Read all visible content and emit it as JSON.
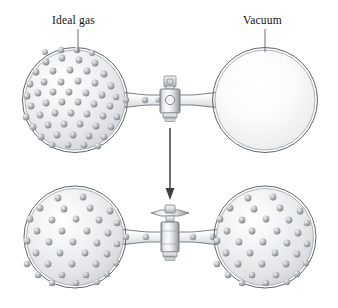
{
  "figure": {
    "background_color": "#ffffff",
    "width": 338,
    "height": 308
  },
  "labels": {
    "ideal_gas": "Ideal gas",
    "vacuum": "Vacuum"
  },
  "palette": {
    "outline": "#5a5f63",
    "outline_inner": "#9aa0a4",
    "glass_light": "#ffffff",
    "glass_mid": "#e4e6e8",
    "glass_dark": "#c3c7cb",
    "particle_light": "#e8eaec",
    "particle_mid": "#a9aeb3",
    "particle_dark": "#7b8186",
    "metal_light": "#f2f3f4",
    "metal_mid": "#c8ccd0",
    "metal_dark": "#868b90",
    "arrow": "#3c3f42",
    "leader": "#6b7074",
    "text": "#111111"
  },
  "panels": [
    {
      "id": "before",
      "name": "valve-closed-state",
      "valve_state": "closed",
      "left_bulb": {
        "contents": "ideal gas",
        "particle_count": 72,
        "filled": true
      },
      "right_bulb": {
        "contents": "vacuum",
        "particle_count": 0,
        "filled": false
      },
      "tube_particles": 3
    },
    {
      "id": "after",
      "name": "valve-open-state",
      "valve_state": "open",
      "left_bulb": {
        "contents": "ideal gas",
        "particle_count": 36,
        "filled": true
      },
      "right_bulb": {
        "contents": "ideal gas",
        "particle_count": 36,
        "filled": true
      },
      "tube_particles": 4
    }
  ],
  "arrow": {
    "name": "process-direction-arrow",
    "direction": "down",
    "x": 170,
    "y_start": 128,
    "y_end": 200
  },
  "leaders": [
    {
      "name": "ideal-gas-leader",
      "x": 78,
      "y_start": 28,
      "y_end": 50
    },
    {
      "name": "vacuum-leader",
      "x": 265,
      "y_start": 28,
      "y_end": 50
    }
  ],
  "geometry": {
    "top_panel": {
      "left_bulb": {
        "cx": 75,
        "cy": 100,
        "r": 52
      },
      "right_bulb": {
        "cx": 265,
        "cy": 100,
        "r": 52
      },
      "tube_y": 100,
      "valve_x": 170
    },
    "bottom_panel": {
      "left_bulb": {
        "cx": 75,
        "cy": 237,
        "r": 50
      },
      "right_bulb": {
        "cx": 265,
        "cy": 237,
        "r": 50
      },
      "tube_y": 237,
      "valve_x": 170
    }
  }
}
